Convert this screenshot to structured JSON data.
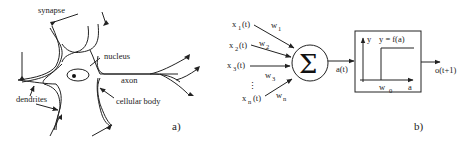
{
  "figure": {
    "panel_a": {
      "caption": "a)",
      "labels": {
        "synapse": "synapse",
        "nucleus": "nucleus",
        "axon": "axon",
        "dendrites": "dendrites",
        "cellular_body": "cellular body"
      }
    },
    "panel_b": {
      "caption": "b)",
      "inputs": [
        {
          "x": "x",
          "sub": "1",
          "t": "(t)",
          "w": "w",
          "wsub": "1"
        },
        {
          "x": "x",
          "sub": "2",
          "t": "(t)",
          "w": "w",
          "wsub": "2"
        },
        {
          "x": "x",
          "sub": "3",
          "t": "(t)",
          "w": "w",
          "wsub": "3"
        },
        {
          "x": "x",
          "sub": "n",
          "t": "(t)",
          "w": "w",
          "wsub": "n"
        }
      ],
      "ellipsis": "⋮",
      "sum_symbol": "Σ",
      "activation": "a(t)",
      "function_box": {
        "y_axis": "y",
        "formula": "y = f(a)",
        "threshold": "w",
        "threshold_sub": "0",
        "x_axis": "a"
      },
      "output": "o(t+1)"
    }
  }
}
